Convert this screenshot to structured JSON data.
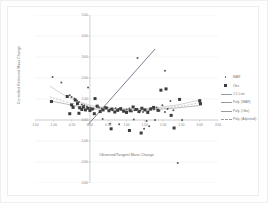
{
  "chart_data": {
    "type": "scatter",
    "title": "",
    "xlabel": "Observed/Tangent Mass Change",
    "ylabel": "Controlled Retrieved Mass Change",
    "xlim": [
      -1.5,
      3.5
    ],
    "ylim": [
      -3.0,
      5.0
    ],
    "xticks": [
      "-1.50",
      "-1.00",
      "-0.50",
      "0.00",
      "0.50",
      "1.00",
      "1.50",
      "2.00",
      "2.50",
      "3.00",
      "3.50"
    ],
    "xtick_values": [
      -1.5,
      -1.0,
      -0.5,
      0.0,
      0.5,
      1.0,
      1.5,
      2.0,
      2.5,
      3.0,
      3.5
    ],
    "yticks": [
      "5.00",
      "4.00",
      "3.00",
      "2.00",
      "1.00",
      "0.00",
      "-1.00",
      "-2.00",
      "-3.00"
    ],
    "ytick_values": [
      5.0,
      4.0,
      3.0,
      2.0,
      1.0,
      0.0,
      -1.0,
      -2.0,
      -3.0
    ],
    "grid": true,
    "legend_position": "right",
    "series": [
      {
        "name": "MAR",
        "marker": "dot",
        "color": "#5a5a5a",
        "points": [
          [
            -1.02,
            2.05
          ],
          [
            -0.78,
            1.78
          ],
          [
            -0.55,
            1.18
          ],
          [
            -0.5,
            1.1
          ],
          [
            -0.42,
            1.02
          ],
          [
            -0.35,
            0.92
          ],
          [
            -0.3,
            0.86
          ],
          [
            -0.22,
            0.74
          ],
          [
            -0.15,
            0.7
          ],
          [
            -0.08,
            0.64
          ],
          [
            -0.05,
            1.55
          ],
          [
            0.02,
            0.58
          ],
          [
            0.1,
            0.52
          ],
          [
            0.18,
            0.66
          ],
          [
            0.25,
            0.6
          ],
          [
            0.32,
            0.55
          ],
          [
            0.4,
            0.62
          ],
          [
            0.48,
            0.58
          ],
          [
            0.55,
            0.5
          ],
          [
            0.62,
            0.46
          ],
          [
            0.7,
            0.56
          ],
          [
            0.78,
            0.52
          ],
          [
            0.85,
            0.48
          ],
          [
            0.92,
            0.44
          ],
          [
            1.0,
            0.5
          ],
          [
            1.08,
            0.55
          ],
          [
            1.15,
            0.4
          ],
          [
            1.22,
            0.46
          ],
          [
            1.3,
            0.52
          ],
          [
            1.38,
            0.44
          ],
          [
            1.45,
            0.38
          ],
          [
            1.52,
            0.48
          ],
          [
            1.6,
            0.42
          ],
          [
            1.68,
            0.56
          ],
          [
            1.75,
            0.5
          ],
          [
            1.82,
            0.6
          ],
          [
            1.9,
            0.44
          ],
          [
            1.98,
            0.7
          ],
          [
            2.05,
            0.38
          ],
          [
            2.12,
            0.52
          ],
          [
            2.2,
            0.9
          ],
          [
            2.28,
            0.46
          ],
          [
            1.3,
            2.95
          ],
          [
            2.05,
            2.35
          ],
          [
            0.55,
            -0.18
          ],
          [
            0.8,
            -0.2
          ],
          [
            1.2,
            0.02
          ],
          [
            1.55,
            -0.05
          ],
          [
            1.48,
            -0.42
          ],
          [
            1.62,
            -0.3
          ],
          [
            2.4,
            -2.05
          ],
          [
            1.78,
            0.0
          ],
          [
            0.35,
            0.05
          ],
          [
            2.52,
            0.0
          ]
        ]
      },
      {
        "name": "Obs",
        "marker": "square",
        "color": "#3c3c3c",
        "points": [
          [
            -1.05,
            0.88
          ],
          [
            -0.62,
            1.12
          ],
          [
            -0.5,
            0.72
          ],
          [
            -0.46,
            0.6
          ],
          [
            -0.4,
            0.95
          ],
          [
            -0.34,
            0.78
          ],
          [
            -0.28,
            0.58
          ],
          [
            -0.22,
            0.5
          ],
          [
            -0.18,
            0.62
          ],
          [
            -0.12,
            0.48
          ],
          [
            -0.05,
            0.56
          ],
          [
            0.0,
            0.45
          ],
          [
            0.06,
            0.52
          ],
          [
            0.14,
            1.02
          ],
          [
            0.2,
            0.66
          ],
          [
            0.28,
            0.4
          ],
          [
            0.36,
            0.48
          ],
          [
            0.44,
            0.58
          ],
          [
            0.52,
            0.44
          ],
          [
            0.6,
            0.52
          ],
          [
            0.68,
            0.38
          ],
          [
            0.76,
            0.46
          ],
          [
            0.84,
            0.54
          ],
          [
            0.92,
            0.42
          ],
          [
            1.0,
            0.36
          ],
          [
            1.1,
            0.44
          ],
          [
            1.18,
            0.62
          ],
          [
            1.26,
            0.5
          ],
          [
            1.34,
            0.4
          ],
          [
            1.42,
            0.56
          ],
          [
            1.5,
            0.48
          ],
          [
            1.58,
            0.36
          ],
          [
            1.66,
            0.52
          ],
          [
            1.74,
            0.6
          ],
          [
            1.86,
            0.46
          ],
          [
            1.94,
            1.42
          ],
          [
            2.08,
            1.48
          ],
          [
            2.22,
            0.22
          ],
          [
            2.3,
            -0.38
          ],
          [
            2.45,
            0.98
          ],
          [
            3.0,
            0.92
          ],
          [
            3.02,
            0.78
          ],
          [
            0.58,
            -0.42
          ],
          [
            1.08,
            -0.5
          ],
          [
            1.4,
            -0.62
          ],
          [
            -0.55,
            0.3
          ],
          [
            -0.3,
            0.32
          ],
          [
            0.12,
            0.3
          ]
        ]
      }
    ],
    "lines": [
      {
        "name": "1:1 Line",
        "style": "solid",
        "color": "#6e6e86",
        "points": [
          [
            -0.05,
            -0.22
          ],
          [
            1.78,
            3.38
          ]
        ]
      },
      {
        "name": "Poly. (MAR)",
        "style": "solid",
        "color": "#b5b5b5",
        "points": [
          [
            -1.1,
            1.62
          ],
          [
            -0.7,
            1.18
          ],
          [
            -0.3,
            0.86
          ],
          [
            0.1,
            0.66
          ],
          [
            0.6,
            0.56
          ],
          [
            1.2,
            0.52
          ],
          [
            1.8,
            0.58
          ],
          [
            2.4,
            0.72
          ],
          [
            3.05,
            0.96
          ]
        ]
      },
      {
        "name": "Poly. (Obs)",
        "style": "solid",
        "color": "#8f8f8f",
        "points": [
          [
            -1.1,
            0.92
          ],
          [
            -0.7,
            0.78
          ],
          [
            -0.3,
            0.64
          ],
          [
            0.1,
            0.54
          ],
          [
            0.6,
            0.48
          ],
          [
            1.2,
            0.46
          ],
          [
            1.8,
            0.5
          ],
          [
            2.4,
            0.58
          ],
          [
            3.05,
            0.7
          ]
        ]
      },
      {
        "name": "Poly. (Adjusted)",
        "style": "dashed",
        "color": "#a8a8a8",
        "points": [
          [
            -1.1,
            1.1
          ],
          [
            -0.6,
            0.84
          ],
          [
            0.0,
            0.62
          ],
          [
            0.7,
            0.52
          ],
          [
            1.4,
            0.5
          ],
          [
            2.1,
            0.58
          ],
          [
            2.7,
            0.72
          ],
          [
            3.05,
            0.84
          ]
        ]
      }
    ]
  },
  "legend": {
    "entries": [
      {
        "label": "MAR",
        "key": "dot"
      },
      {
        "label": "Obs",
        "key": "square"
      },
      {
        "label": "1:1 Line",
        "key": "line"
      },
      {
        "label": "Poly. (MAR)",
        "key": "line"
      },
      {
        "label": "Poly. (Obs)",
        "key": "line"
      },
      {
        "label": "Poly. (Adjusted)",
        "key": "dash"
      }
    ]
  },
  "colors": {
    "marker_dot": "#5a5a5a",
    "marker_square": "#3c3c3c",
    "line_identity": "#6e6e86",
    "grid": "#e8e8e8",
    "axis": "#bdbdbd",
    "text": "#707070",
    "background": "#ffffff"
  }
}
